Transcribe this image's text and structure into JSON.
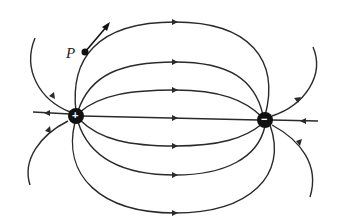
{
  "diagram": {
    "point_label": "P",
    "charges": [
      {
        "name": "positive-charge",
        "sign": "+",
        "x": 76,
        "y": 116
      },
      {
        "name": "negative-charge",
        "sign": "−",
        "x": 265,
        "y": 120
      }
    ],
    "colors": {
      "line": "#2a2a2a",
      "charge": "#111111",
      "background": "#ffffff"
    },
    "field_line_count": 11
  }
}
